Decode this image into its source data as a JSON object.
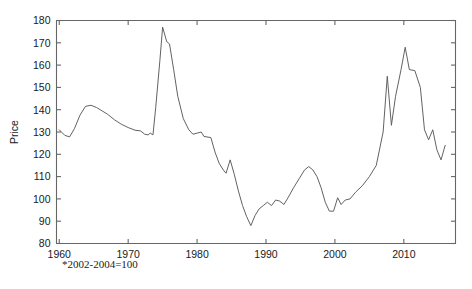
{
  "footnote": "*2002-2004=100",
  "colors": {
    "background": "#ffffff",
    "axis": "#666666",
    "line": "#5a5a5a",
    "text": "#1a1a1a"
  },
  "chart_data": {
    "type": "line",
    "title": "",
    "subtitle": "",
    "xlabel": "",
    "ylabel": "Price",
    "note": "*2002-2004=100",
    "xlim": [
      1960,
      2017
    ],
    "ylim": [
      80,
      180
    ],
    "grid": false,
    "legend": null,
    "xticks": [
      1960,
      1970,
      1980,
      1990,
      2000,
      2010
    ],
    "xtick_labels": [
      "1960",
      "1970",
      "1980",
      "1990",
      "2000",
      "2010"
    ],
    "yticks": [
      80,
      90,
      100,
      110,
      120,
      130,
      140,
      150,
      160,
      170,
      180
    ],
    "ytick_labels": [
      "80",
      "90",
      "100",
      "110",
      "120",
      "130",
      "140",
      "150",
      "160",
      "170",
      "180"
    ],
    "series": [
      {
        "name": "Price",
        "x": [
          1960,
          1961,
          1962,
          1963,
          1964,
          1965,
          1966,
          1967,
          1968,
          1969,
          1970,
          1971,
          1972,
          1973,
          1974,
          1975,
          1976,
          1977,
          1978,
          1979,
          1980,
          1981,
          1982,
          1983,
          1984,
          1985,
          1986,
          1987,
          1988,
          1989,
          1990,
          1991,
          1992,
          1993,
          1994,
          1995,
          1996,
          1997,
          1998,
          1999,
          2000,
          2001,
          2002,
          2003,
          2004,
          2005,
          2006,
          2007,
          2008,
          2009,
          2010,
          2011,
          2012,
          2013,
          2014,
          2015,
          2016,
          2017
        ],
        "values": [
          131,
          129.5,
          128,
          134,
          140,
          141.5,
          141,
          139.5,
          137,
          135,
          133.5,
          131,
          130.5,
          131,
          177,
          170,
          152,
          140,
          136,
          134.5,
          137,
          132,
          127,
          124,
          118,
          111,
          114,
          118,
          113,
          108,
          103,
          98,
          93.5,
          88.5,
          92,
          96,
          97.5,
          97,
          99,
          98,
          101,
          105,
          108,
          117,
          115,
          110,
          103.5,
          102,
          103,
          109,
          114,
          113,
          120,
          129,
          155,
          132,
          140,
          152
        ]
      }
    ],
    "series_detail_points": [
      [
        1960,
        131
      ],
      [
        1960.8,
        128.5
      ],
      [
        1961.5,
        127.8
      ],
      [
        1962.2,
        131.5
      ],
      [
        1963.0,
        137.5
      ],
      [
        1963.8,
        141.5
      ],
      [
        1964.6,
        142.0
      ],
      [
        1965.4,
        141.0
      ],
      [
        1966.2,
        139.5
      ],
      [
        1967.0,
        138.0
      ],
      [
        1968.0,
        135.5
      ],
      [
        1969.0,
        133.5
      ],
      [
        1970.0,
        132.0
      ],
      [
        1971.0,
        130.8
      ],
      [
        1971.8,
        130.5
      ],
      [
        1972.4,
        129.0
      ],
      [
        1972.9,
        128.7
      ],
      [
        1973.2,
        129.5
      ],
      [
        1973.6,
        128.7
      ],
      [
        1974.0,
        141.0
      ],
      [
        1974.6,
        162.0
      ],
      [
        1975.0,
        177.0
      ],
      [
        1975.6,
        170.5
      ],
      [
        1976.0,
        169.5
      ],
      [
        1976.6,
        158.0
      ],
      [
        1977.2,
        146.0
      ],
      [
        1978.0,
        136.0
      ],
      [
        1978.8,
        131.0
      ],
      [
        1979.4,
        129.0
      ],
      [
        1980.0,
        129.5
      ],
      [
        1980.6,
        130.0
      ],
      [
        1981.0,
        128.0
      ],
      [
        1982.0,
        127.5
      ],
      [
        1982.6,
        121.0
      ],
      [
        1983.2,
        116.0
      ],
      [
        1983.8,
        113.0
      ],
      [
        1984.2,
        111.5
      ],
      [
        1984.8,
        117.5
      ],
      [
        1985.4,
        111.0
      ],
      [
        1986.0,
        103.5
      ],
      [
        1986.6,
        97.0
      ],
      [
        1987.2,
        92.0
      ],
      [
        1987.8,
        88.0
      ],
      [
        1988.4,
        92.5
      ],
      [
        1989.0,
        95.5
      ],
      [
        1989.6,
        97.0
      ],
      [
        1990.2,
        98.5
      ],
      [
        1990.8,
        97.0
      ],
      [
        1991.4,
        99.5
      ],
      [
        1992.0,
        99.0
      ],
      [
        1992.6,
        97.5
      ],
      [
        1993.2,
        100.5
      ],
      [
        1994.0,
        105.0
      ],
      [
        1994.8,
        109.0
      ],
      [
        1995.6,
        113.0
      ],
      [
        1996.2,
        114.5
      ],
      [
        1996.8,
        113.0
      ],
      [
        1997.4,
        110.0
      ],
      [
        1998.0,
        105.0
      ],
      [
        1998.6,
        98.5
      ],
      [
        1999.2,
        94.5
      ],
      [
        1999.8,
        94.5
      ],
      [
        2000.4,
        100.5
      ],
      [
        2000.9,
        97.5
      ],
      [
        2001.5,
        99.5
      ],
      [
        2002.2,
        100.0
      ],
      [
        2003.0,
        103.0
      ],
      [
        2004.0,
        106.0
      ],
      [
        2005.0,
        110.0
      ],
      [
        2006.0,
        115.0
      ],
      [
        2007.0,
        130.0
      ],
      [
        2007.6,
        155.0
      ],
      [
        2008.2,
        133.0
      ],
      [
        2008.8,
        146.0
      ],
      [
        2009.6,
        158.0
      ],
      [
        2010.2,
        168.0
      ],
      [
        2010.8,
        158.0
      ],
      [
        2011.6,
        157.5
      ],
      [
        2012.4,
        150.0
      ],
      [
        2013.0,
        131.0
      ],
      [
        2013.6,
        126.5
      ],
      [
        2014.2,
        131.0
      ],
      [
        2014.8,
        122.0
      ],
      [
        2015.4,
        117.5
      ],
      [
        2016.0,
        124.0
      ]
    ]
  }
}
